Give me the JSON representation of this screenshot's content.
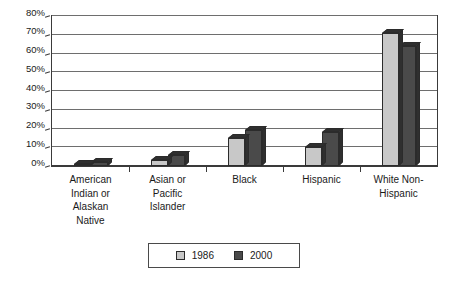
{
  "chart_data": {
    "type": "bar",
    "title": "",
    "subtitle": "",
    "xlabel": "",
    "ylabel": "",
    "ylim": [
      0,
      80
    ],
    "y_tick_step": 10,
    "y_tick_labels": [
      "0%",
      "10%",
      "20%",
      "30%",
      "40%",
      "50%",
      "60%",
      "70%",
      "80%"
    ],
    "y_tick_values": [
      0,
      10,
      20,
      30,
      40,
      50,
      60,
      70,
      80
    ],
    "grid": true,
    "legend_position": "bottom",
    "categories": [
      "American Indian or Alaskan Native",
      "Asian or Pacific Islander",
      "Black",
      "Hispanic",
      "White Non-Hispanic"
    ],
    "category_label_lines": [
      [
        "American",
        "Indian or",
        "Alaskan",
        "Native"
      ],
      [
        "Asian or",
        "Pacific",
        "Islander"
      ],
      [
        "Black"
      ],
      [
        "Hispanic"
      ],
      [
        "White Non-",
        "Hispanic"
      ]
    ],
    "series": [
      {
        "name": "1986",
        "color": "#c8c8c8",
        "values": [
          1,
          3,
          15,
          10,
          71
        ]
      },
      {
        "name": "2000",
        "color": "#4a4a4a",
        "values": [
          2,
          6,
          19,
          18,
          64
        ]
      }
    ]
  },
  "legend": {
    "items": [
      {
        "label": "1986",
        "color": "#c8c8c8"
      },
      {
        "label": "2000",
        "color": "#4a4a4a"
      }
    ]
  },
  "colors": {
    "series_1986": "#c8c8c8",
    "series_2000": "#4a4a4a",
    "axis": "#3a3a3a",
    "gridline": "#6e6e6e",
    "background": "#ffffff",
    "text": "#1a1a1a"
  }
}
